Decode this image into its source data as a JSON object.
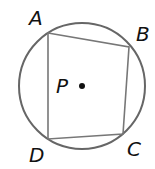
{
  "diagram": {
    "circle": {
      "cx": 82,
      "cy": 86,
      "r": 63,
      "stroke": "#666666"
    },
    "center": {
      "label": "P",
      "x": 82,
      "y": 86
    },
    "vertices": [
      {
        "label": "A",
        "x": 48,
        "y": 33,
        "lx": 30,
        "ly": 25
      },
      {
        "label": "B",
        "x": 129,
        "y": 47,
        "lx": 137,
        "ly": 41
      },
      {
        "label": "C",
        "x": 123,
        "y": 134,
        "lx": 127,
        "ly": 156
      },
      {
        "label": "D",
        "x": 48,
        "y": 139,
        "lx": 29,
        "ly": 162
      }
    ],
    "quad_stroke": "#666666"
  }
}
